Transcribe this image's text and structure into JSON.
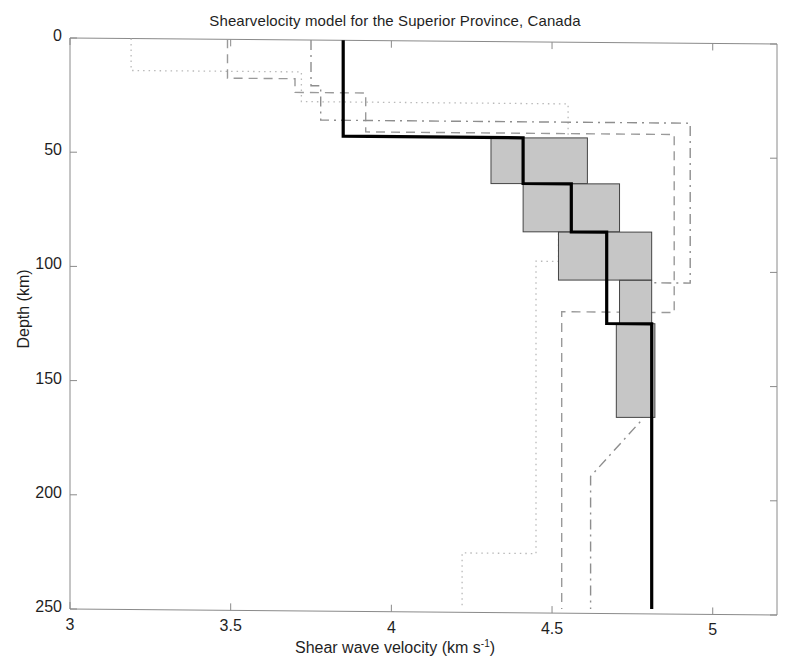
{
  "chart_data": {
    "type": "line",
    "title": "Shearvelocity model for the Superior Province, Canada",
    "xlabel": "Shear wave velocity (km s",
    "xlabel_sup": "-1",
    "xlabel_tail": ")",
    "ylabel": "Depth (km)",
    "xlim": [
      3,
      5.2
    ],
    "ylim": [
      250,
      0
    ],
    "y_inverted": true,
    "grid": false,
    "legend": "none",
    "xticks": [
      3,
      3.5,
      4,
      4.5,
      5
    ],
    "xtick_labels": [
      "3",
      "3.5",
      "4",
      "4.5",
      "5"
    ],
    "yticks": [
      0,
      50,
      100,
      150,
      200,
      250
    ],
    "ytick_labels": [
      "0",
      "50",
      "100",
      "150",
      "200",
      "250"
    ],
    "series": [
      {
        "name": "preferred-model",
        "style": "solid-bold",
        "color": "#000000",
        "width": 3.2,
        "description": "Preferred shear velocity step model (bold black staircase)",
        "points": [
          {
            "v": 3.85,
            "z": 0
          },
          {
            "v": 3.85,
            "z": 42
          },
          {
            "v": 4.41,
            "z": 42
          },
          {
            "v": 4.41,
            "z": 62
          },
          {
            "v": 4.56,
            "z": 62
          },
          {
            "v": 4.56,
            "z": 83
          },
          {
            "v": 4.67,
            "z": 83
          },
          {
            "v": 4.67,
            "z": 123
          },
          {
            "v": 4.81,
            "z": 123
          },
          {
            "v": 4.81,
            "z": 250
          }
        ]
      },
      {
        "name": "reference-model-dotted",
        "style": "dotted",
        "color": "#b9b9b9",
        "width": 1.3,
        "description": "Light dotted reference velocity profile",
        "points": [
          {
            "v": 3.19,
            "z": 0
          },
          {
            "v": 3.19,
            "z": 14
          },
          {
            "v": 3.72,
            "z": 14
          },
          {
            "v": 3.72,
            "z": 27
          },
          {
            "v": 4.55,
            "z": 27
          },
          {
            "v": 4.55,
            "z": 48
          },
          {
            "v": 4.52,
            "z": 48
          },
          {
            "v": 4.52,
            "z": 96
          },
          {
            "v": 4.45,
            "z": 96
          },
          {
            "v": 4.45,
            "z": 224
          },
          {
            "v": 4.22,
            "z": 224
          },
          {
            "v": 4.22,
            "z": 250
          }
        ]
      },
      {
        "name": "reference-model-dashed",
        "style": "dashed",
        "color": "#9a9a9a",
        "width": 1.4,
        "description": "Light dashed reference velocity profile",
        "points": [
          {
            "v": 3.49,
            "z": 0
          },
          {
            "v": 3.49,
            "z": 17
          },
          {
            "v": 3.7,
            "z": 17
          },
          {
            "v": 3.7,
            "z": 23
          },
          {
            "v": 3.92,
            "z": 23
          },
          {
            "v": 3.92,
            "z": 40
          },
          {
            "v": 4.88,
            "z": 40
          },
          {
            "v": 4.88,
            "z": 118
          },
          {
            "v": 4.53,
            "z": 118
          },
          {
            "v": 4.53,
            "z": 250
          }
        ]
      },
      {
        "name": "reference-model-dashdot",
        "style": "dash-dot",
        "color": "#8e8e8e",
        "width": 1.4,
        "description": "Light dash-dot reference velocity profile",
        "points": [
          {
            "v": 3.75,
            "z": 0
          },
          {
            "v": 3.75,
            "z": 20
          },
          {
            "v": 3.78,
            "z": 20
          },
          {
            "v": 3.78,
            "z": 35
          },
          {
            "v": 4.93,
            "z": 35
          },
          {
            "v": 4.93,
            "z": 105
          },
          {
            "v": 4.78,
            "z": 105
          },
          {
            "v": 4.78,
            "z": 165
          },
          {
            "v": 4.62,
            "z": 190
          },
          {
            "v": 4.62,
            "z": 250
          }
        ]
      }
    ],
    "uncertainty_boxes": {
      "name": "velocity-uncertainty-boxes",
      "fill": "#c6c6c6",
      "stroke": "#444444",
      "description": "Grey rectangles showing velocity and depth uncertainty for each layer",
      "boxes": [
        {
          "v_min": 4.31,
          "v_max": 4.61,
          "z_top": 42,
          "z_bottom": 62
        },
        {
          "v_min": 4.41,
          "v_max": 4.71,
          "z_top": 62,
          "z_bottom": 83
        },
        {
          "v_min": 4.52,
          "v_max": 4.81,
          "z_top": 83,
          "z_bottom": 104
        },
        {
          "v_min": 4.71,
          "v_max": 4.81,
          "z_top": 104,
          "z_bottom": 123
        },
        {
          "v_min": 4.7,
          "v_max": 4.82,
          "z_top": 123,
          "z_bottom": 164
        }
      ]
    }
  },
  "axes": {
    "frame_color": "#8a8a8a",
    "tick_color": "#8a8a8a"
  }
}
